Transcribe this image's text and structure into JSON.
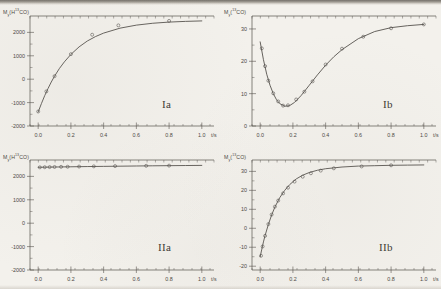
{
  "figure": {
    "background_color": "#f3f1ec",
    "ink_color": "#4b4843",
    "x_unit_label": "t/s",
    "x_ticks": [
      "0.0",
      "0.2",
      "0.4",
      "0.6",
      "0.8",
      "1.0"
    ]
  },
  "panels": [
    {
      "tag": "Ia",
      "ylabel_main": "M",
      "ylabel_sub": "y",
      "ylabel_paren_open": "(H",
      "ylabel_sup": "13",
      "ylabel_rest": "CO)",
      "ylabel_text": "My(H13CO)",
      "y_ticks": [
        "2000",
        "1000",
        "0",
        "-1000",
        "-2000"
      ]
    },
    {
      "tag": "Ib",
      "ylabel_main": "M",
      "ylabel_sub": "y",
      "ylabel_paren_open": "(",
      "ylabel_sup": "13",
      "ylabel_rest": "CO)",
      "ylabel_text": "My(13CO)",
      "y_ticks": [
        "30",
        "20",
        "10",
        "0"
      ]
    },
    {
      "tag": "IIa",
      "ylabel_main": "M",
      "ylabel_sub": "y",
      "ylabel_paren_open": "(H",
      "ylabel_sup": "13",
      "ylabel_rest": "CO)",
      "ylabel_text": "My(H13CO)",
      "y_ticks": [
        "2000",
        "1000",
        "0",
        "-1000",
        "-2000"
      ]
    },
    {
      "tag": "IIb",
      "ylabel_main": "M",
      "ylabel_sub": "y",
      "ylabel_paren_open": "(",
      "ylabel_sup": "13",
      "ylabel_rest": "CO)",
      "ylabel_text": "My(13CO)",
      "y_ticks": [
        "30",
        "20",
        "10",
        "0",
        "-10",
        "-20"
      ]
    }
  ],
  "chart_data": [
    {
      "type": "line",
      "id": "Ia",
      "title": "Ia",
      "xlabel": "t/s",
      "ylabel": "My(H13CO)",
      "xlim": [
        -0.05,
        1.05
      ],
      "ylim": [
        -2000,
        2700
      ],
      "xticks": [
        0.0,
        0.2,
        0.4,
        0.6,
        0.8,
        1.0
      ],
      "yticks": [
        -2000,
        -1000,
        0,
        1000,
        2000
      ],
      "grid": false,
      "legend": "none",
      "series": [
        {
          "name": "fit",
          "kind": "line",
          "x": [
            0.0,
            0.02,
            0.04,
            0.06,
            0.08,
            0.1,
            0.13,
            0.16,
            0.2,
            0.25,
            0.3,
            0.35,
            0.4,
            0.5,
            0.6,
            0.7,
            0.8,
            0.9,
            1.0
          ],
          "y": [
            -1400,
            -1040,
            -700,
            -400,
            -120,
            130,
            460,
            740,
            1060,
            1380,
            1630,
            1820,
            1970,
            2180,
            2310,
            2390,
            2440,
            2470,
            2490
          ]
        },
        {
          "name": "measured",
          "kind": "scatter",
          "x": [
            0.0,
            0.05,
            0.1,
            0.2,
            0.33,
            0.49,
            0.8
          ],
          "y": [
            -1380,
            -520,
            130,
            1070,
            1900,
            2300,
            2490
          ]
        }
      ]
    },
    {
      "type": "line",
      "id": "Ib",
      "title": "Ib",
      "xlabel": "t/s",
      "ylabel": "My(13CO)",
      "xlim": [
        -0.05,
        1.05
      ],
      "ylim": [
        0,
        34
      ],
      "xticks": [
        0.0,
        0.2,
        0.4,
        0.6,
        0.8,
        1.0
      ],
      "yticks": [
        0,
        10,
        20,
        30
      ],
      "grid": false,
      "legend": "none",
      "series": [
        {
          "name": "fit",
          "kind": "line",
          "x": [
            0.0,
            0.02,
            0.04,
            0.06,
            0.08,
            0.1,
            0.12,
            0.15,
            0.18,
            0.21,
            0.25,
            0.3,
            0.35,
            0.4,
            0.45,
            0.5,
            0.6,
            0.7,
            0.8,
            0.9,
            1.0
          ],
          "y": [
            26.0,
            20.5,
            16.0,
            12.6,
            10.0,
            8.1,
            6.9,
            6.1,
            6.3,
            7.3,
            9.4,
            12.6,
            15.8,
            18.8,
            21.4,
            23.6,
            27.0,
            29.2,
            30.4,
            31.0,
            31.4
          ]
        },
        {
          "name": "measured",
          "kind": "scatter",
          "x": [
            0.01,
            0.03,
            0.05,
            0.08,
            0.11,
            0.14,
            0.17,
            0.22,
            0.27,
            0.32,
            0.4,
            0.5,
            0.63,
            0.8,
            1.0
          ],
          "y": [
            24.0,
            18.5,
            14.0,
            10.1,
            7.6,
            6.3,
            6.4,
            8.2,
            10.6,
            13.8,
            19.0,
            23.9,
            27.6,
            30.2,
            31.4
          ]
        }
      ]
    },
    {
      "type": "line",
      "id": "IIa",
      "title": "IIa",
      "xlabel": "t/s",
      "ylabel": "My(H13CO)",
      "xlim": [
        -0.05,
        1.05
      ],
      "ylim": [
        -2000,
        2700
      ],
      "xticks": [
        0.0,
        0.2,
        0.4,
        0.6,
        0.8,
        1.0
      ],
      "yticks": [
        -2000,
        -1000,
        0,
        1000,
        2000
      ],
      "grid": false,
      "legend": "none",
      "series": [
        {
          "name": "fit",
          "kind": "line",
          "x": [
            0.0,
            0.1,
            0.2,
            0.3,
            0.4,
            0.5,
            0.6,
            0.7,
            0.8,
            0.9,
            1.0
          ],
          "y": [
            2390,
            2400,
            2410,
            2420,
            2428,
            2436,
            2444,
            2452,
            2458,
            2464,
            2470
          ]
        },
        {
          "name": "measured",
          "kind": "scatter",
          "x": [
            0.01,
            0.04,
            0.07,
            0.1,
            0.14,
            0.18,
            0.25,
            0.34,
            0.47,
            0.66,
            0.8
          ],
          "y": [
            2386,
            2392,
            2398,
            2402,
            2408,
            2412,
            2420,
            2428,
            2440,
            2452,
            2460
          ]
        }
      ]
    },
    {
      "type": "line",
      "id": "IIb",
      "title": "IIb",
      "xlabel": "t/s",
      "ylabel": "My(13CO)",
      "xlim": [
        -0.05,
        1.05
      ],
      "ylim": [
        -22,
        36
      ],
      "xticks": [
        0.0,
        0.2,
        0.4,
        0.6,
        0.8,
        1.0
      ],
      "yticks": [
        -20,
        -10,
        0,
        10,
        20,
        30
      ],
      "grid": false,
      "legend": "none",
      "series": [
        {
          "name": "fit",
          "kind": "line",
          "x": [
            0.0,
            0.01,
            0.02,
            0.03,
            0.05,
            0.07,
            0.09,
            0.12,
            0.15,
            0.18,
            0.22,
            0.26,
            0.3,
            0.35,
            0.4,
            0.5,
            0.6,
            0.7,
            0.8,
            0.9,
            1.0
          ],
          "y": [
            -15.0,
            -11.0,
            -7.2,
            -3.8,
            2.0,
            7.0,
            11.2,
            16.2,
            20.0,
            23.0,
            26.0,
            28.0,
            29.4,
            30.6,
            31.4,
            32.3,
            32.8,
            33.0,
            33.2,
            33.3,
            33.4
          ]
        },
        {
          "name": "measured",
          "kind": "scatter",
          "x": [
            0.005,
            0.015,
            0.03,
            0.05,
            0.07,
            0.09,
            0.11,
            0.14,
            0.17,
            0.21,
            0.26,
            0.31,
            0.37,
            0.45,
            0.62,
            0.8
          ],
          "y": [
            -14.5,
            -9.6,
            -4.0,
            2.2,
            7.2,
            11.4,
            14.6,
            18.4,
            21.4,
            24.6,
            27.2,
            29.0,
            30.4,
            31.6,
            32.6,
            33.2
          ]
        }
      ]
    }
  ]
}
